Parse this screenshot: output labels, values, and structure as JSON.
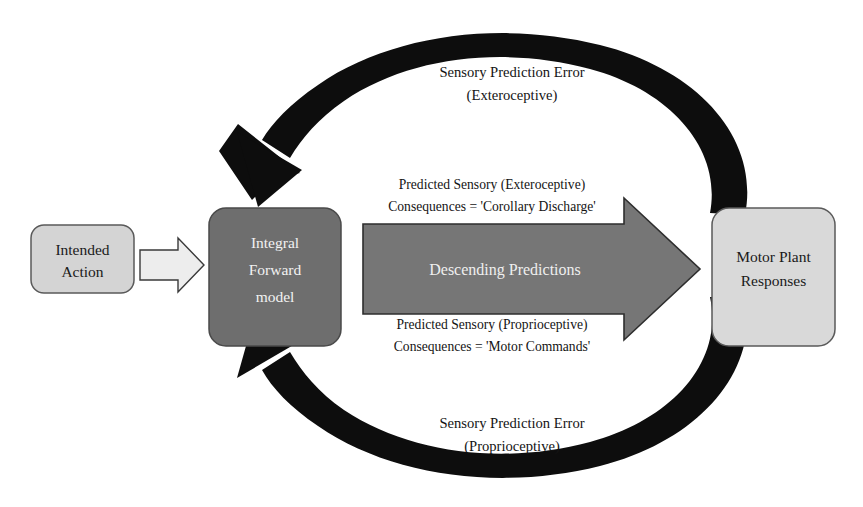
{
  "diagram": {
    "background_color": "#ffffff",
    "nodes": [
      {
        "id": "intended-action",
        "label_lines": [
          "Intended",
          "Action"
        ],
        "fill": "#d4d4d4",
        "stroke": "#5a5a5a",
        "text_color": "#1a1a1a"
      },
      {
        "id": "integral-forward-model",
        "label_lines": [
          "Integral",
          "Forward",
          "model"
        ],
        "fill": "#6e6e6e",
        "stroke": "#4a4a4a",
        "text_color": "#f2f2f2"
      },
      {
        "id": "motor-plant-responses",
        "label_lines": [
          "Motor Plant",
          "Responses"
        ],
        "fill": "#d9d9d9",
        "stroke": "#5a5a5a",
        "text_color": "#1a1a1a"
      }
    ],
    "edges": [
      {
        "id": "intended-to-model",
        "type": "block-arrow",
        "fill": "#e8e8e8",
        "stroke": "#3a3a3a",
        "label": ""
      },
      {
        "id": "descending-predictions",
        "type": "block-arrow",
        "fill": "#767676",
        "stroke": "#2e2e2e",
        "label": "Descending Predictions",
        "label_color": "#efefef",
        "annotation_top": [
          "Predicted Sensory (Exteroceptive)",
          "Consequences = 'Corollary Discharge'"
        ],
        "annotation_bottom": [
          "Predicted Sensory (Proprioceptive)",
          "Consequences = 'Motor Commands'"
        ]
      },
      {
        "id": "sensory-prediction-error-exteroceptive",
        "type": "curved-arrow",
        "color": "#0d0d0d",
        "direction": "right-to-left",
        "label_lines": [
          "Sensory Prediction Error",
          "(Exteroceptive)"
        ]
      },
      {
        "id": "sensory-prediction-error-proprioceptive",
        "type": "curved-arrow",
        "color": "#0d0d0d",
        "direction": "right-to-left",
        "label_lines": [
          "Sensory Prediction Error",
          "(Proprioceptive)"
        ]
      }
    ]
  }
}
